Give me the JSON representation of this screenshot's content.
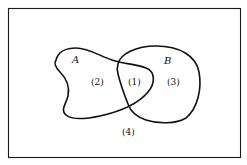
{
  "diagram": {
    "type": "venn",
    "universe": {
      "label": ""
    },
    "sets": [
      {
        "id": "A",
        "label": "A"
      },
      {
        "id": "B",
        "label": "B"
      }
    ],
    "regions": [
      {
        "id": "1",
        "label": "(1)",
        "description": "A ∩ B"
      },
      {
        "id": "2",
        "label": "(2)",
        "description": "A only"
      },
      {
        "id": "3",
        "label": "(3)",
        "description": "B only"
      },
      {
        "id": "4",
        "label": "(4)",
        "description": "outside A and B"
      }
    ],
    "colors": {
      "stroke": "#111111",
      "background": "#ffffff"
    }
  }
}
